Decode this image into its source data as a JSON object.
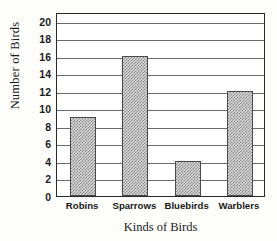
{
  "chart_data": {
    "type": "bar",
    "title": "",
    "categories": [
      "Robins",
      "Sparrows",
      "Bluebirds",
      "Warblers"
    ],
    "values": [
      9,
      16,
      4,
      12
    ],
    "xlabel": "Kinds of Birds",
    "ylabel": "Number of Birds",
    "ylim": [
      0,
      21
    ],
    "yticks": [
      0,
      2,
      4,
      6,
      8,
      10,
      12,
      14,
      16,
      18,
      20
    ],
    "ytick_labels": [
      "0",
      "2",
      "4",
      "6",
      "8",
      "10",
      "12",
      "14",
      "16",
      "18",
      "20"
    ],
    "grid": true,
    "grid_axis": "y",
    "legend": false,
    "legend_position": "none",
    "bar_fill": "#d7d7d7",
    "bar_pattern": "checkerboard-stipple",
    "bar_edge_color": "#4a4a4a",
    "grid_color": "#6a6a6a",
    "frame_color": "#2a2a2a",
    "background": "#ffffff"
  }
}
